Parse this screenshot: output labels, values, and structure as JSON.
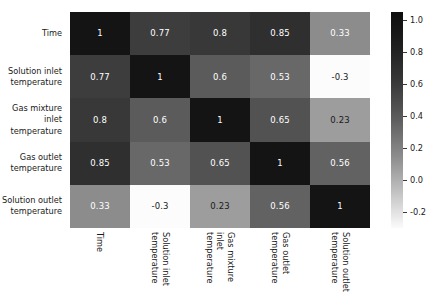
{
  "chart_data": {
    "type": "heatmap",
    "title": "",
    "xlabel": "",
    "ylabel": "",
    "grid": false,
    "legend_position": "right",
    "colormap": "grayscale-reversed",
    "categories": [
      "Time",
      "Solution inlet temperature",
      "Gas mixture inlet temperature",
      "Gas outlet temperature",
      "Solution outlet temperature"
    ],
    "x_tick_labels": [
      "Time",
      "Solution inlet temperature",
      "Gas mixture inlet temperature",
      "Gas outlet temperature",
      "Solution outlet temperature"
    ],
    "y_tick_labels": [
      "Time",
      "Solution inlet temperature",
      "Gas mixture inlet temperature",
      "Gas outlet temperature",
      "Solution outlet temperature"
    ],
    "matrix": [
      [
        1,
        0.77,
        0.8,
        0.85,
        0.33
      ],
      [
        0.77,
        1,
        0.6,
        0.53,
        -0.3
      ],
      [
        0.8,
        0.6,
        1,
        0.65,
        0.23
      ],
      [
        0.85,
        0.53,
        0.65,
        1,
        0.56
      ],
      [
        0.33,
        -0.3,
        0.23,
        0.56,
        1
      ]
    ],
    "cell_labels": [
      [
        "1",
        "0.77",
        "0.8",
        "0.85",
        "0.33"
      ],
      [
        "0.77",
        "1",
        "0.6",
        "0.53",
        "-0.3"
      ],
      [
        "0.8",
        "0.6",
        "1",
        "0.65",
        "0.23"
      ],
      [
        "0.85",
        "0.53",
        "0.65",
        "1",
        "0.56"
      ],
      [
        "0.33",
        "-0.3",
        "0.23",
        "0.56",
        "1"
      ]
    ],
    "colorbar": {
      "ticks": [
        "1.0",
        "0.8",
        "0.6",
        "0.4",
        "0.2",
        "0.0",
        "-0.2"
      ],
      "tick_values": [
        1.0,
        0.8,
        0.6,
        0.4,
        0.2,
        0.0,
        -0.2
      ],
      "vmin": -0.3,
      "vmax": 1.0,
      "range_min": -0.3,
      "range_max": 1.05
    }
  },
  "colors": {
    "background": "#ffffff",
    "text": "#1a1a1a",
    "cell_text_light": "#ffffff",
    "cell_text_dark": "#1a1a1a",
    "colormap_low": "#ffffff",
    "colormap_high": "#0d0d0d"
  }
}
